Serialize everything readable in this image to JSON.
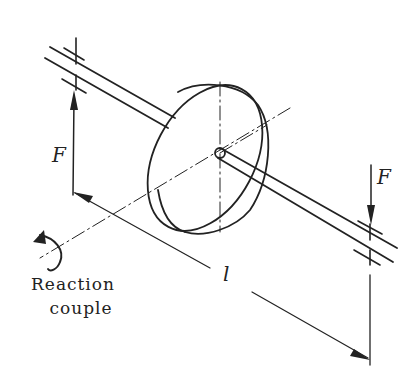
{
  "figure": {
    "labels": {
      "force_left": "F",
      "force_right": "F",
      "length": "l",
      "reaction_line1": "Reaction",
      "reaction_line2": "couple"
    },
    "colors": {
      "ink": "#222222",
      "background": "#ffffff"
    }
  }
}
